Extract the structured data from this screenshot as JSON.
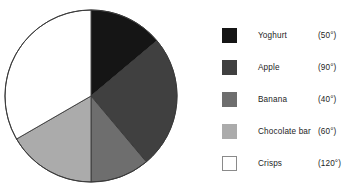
{
  "chart_data": {
    "type": "pie",
    "title": "",
    "subtitle": "",
    "units": "degrees",
    "total_degrees": 360,
    "start_angle_deg": 0,
    "direction": "clockwise",
    "legend_position": "right",
    "grid": false,
    "categories": [
      "Yoghurt",
      "Apple",
      "Banana",
      "Chocolate bar",
      "Crisps"
    ],
    "values": [
      50,
      90,
      40,
      60,
      120
    ],
    "value_labels": [
      "(50°)",
      "(90°)",
      "(40°)",
      "(60°)",
      "(120°)"
    ],
    "colors": [
      "#151515",
      "#404040",
      "#6e6e6e",
      "#ababab",
      "#ffffff"
    ],
    "slices": [
      {
        "label": "Yoghurt",
        "degrees": 50,
        "degrees_label": "(50°)",
        "color": "#151515",
        "start_deg": 0,
        "end_deg": 50
      },
      {
        "label": "Apple",
        "degrees": 90,
        "degrees_label": "(90°)",
        "color": "#404040",
        "start_deg": 50,
        "end_deg": 140
      },
      {
        "label": "Banana",
        "degrees": 40,
        "degrees_label": "(40°)",
        "color": "#6e6e6e",
        "start_deg": 140,
        "end_deg": 180
      },
      {
        "label": "Chocolate bar",
        "degrees": 60,
        "degrees_label": "(60°)",
        "color": "#ababab",
        "start_deg": 180,
        "end_deg": 240
      },
      {
        "label": "Crisps",
        "degrees": 120,
        "degrees_label": "(120°)",
        "color": "#ffffff",
        "start_deg": 240,
        "end_deg": 360
      }
    ]
  },
  "pie": {
    "center_x": 91,
    "center_y": 96,
    "radius": 86,
    "outline_color": "#3a3a3a"
  },
  "legend": {
    "rows": [
      {
        "label": "Yoghurt",
        "degrees_label": "(50°)",
        "color": "#151515",
        "top": 28
      },
      {
        "label": "Apple",
        "degrees_label": "(90°)",
        "color": "#404040",
        "top": 60
      },
      {
        "label": "Banana",
        "degrees_label": "(40°)",
        "color": "#6e6e6e",
        "top": 92
      },
      {
        "label": "Chocolate bar",
        "degrees_label": "(60°)",
        "color": "#ababab",
        "top": 124
      },
      {
        "label": "Crisps",
        "degrees_label": "(120°)",
        "color": "#ffffff",
        "top": 156
      }
    ]
  }
}
